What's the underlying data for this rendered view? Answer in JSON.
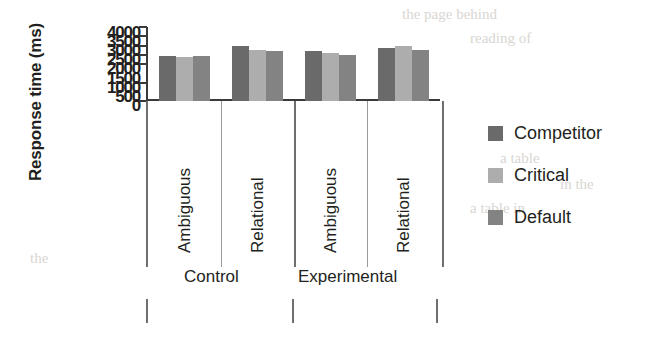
{
  "chart_data": {
    "type": "bar",
    "title": "",
    "xlabel": "",
    "ylabel": "Response time (ms)",
    "ylim": [
      0,
      4000
    ],
    "ytick_labels": [
      "4000",
      "3500",
      "3000",
      "2500",
      "2000",
      "1500",
      "1000",
      "500",
      "0"
    ],
    "ytick_values": [
      4000,
      3500,
      3000,
      2500,
      2000,
      1500,
      1000,
      500,
      0
    ],
    "grid": false,
    "legend_position": "right",
    "categories": [
      "Ambiguous",
      "Relational",
      "Ambiguous",
      "Relational"
    ],
    "group_labels": [
      "Control",
      "Experimental"
    ],
    "series": [
      {
        "name": "Competitor",
        "color": "#6a6a6a",
        "values": [
          2450,
          2950,
          2700,
          2850
        ]
      },
      {
        "name": "Critical",
        "color": "#adadad",
        "values": [
          2400,
          2750,
          2600,
          2950
        ]
      },
      {
        "name": "Default",
        "color": "#838383",
        "values": [
          2420,
          2720,
          2480,
          2780
        ]
      }
    ]
  },
  "legend": {
    "items": [
      {
        "label": "Competitor",
        "color": "#6a6a6a"
      },
      {
        "label": "Critical",
        "color": "#adadad"
      },
      {
        "label": "Default",
        "color": "#838383"
      }
    ]
  },
  "page_bleed": [
    {
      "text": "the page behind",
      "x": 402,
      "y": 6
    },
    {
      "text": "reading of",
      "x": 470,
      "y": 30
    },
    {
      "text": "a table",
      "x": 500,
      "y": 150
    },
    {
      "text": "in the",
      "x": 560,
      "y": 176
    },
    {
      "text": "a table in",
      "x": 470,
      "y": 200
    },
    {
      "text": "the",
      "x": 30,
      "y": 250
    }
  ]
}
